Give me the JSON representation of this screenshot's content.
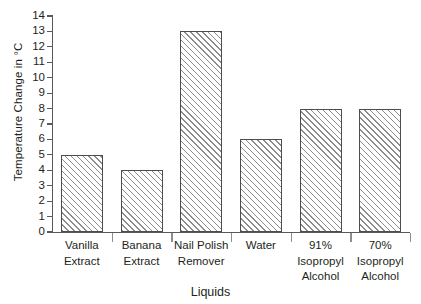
{
  "chart_data": {
    "type": "bar",
    "title": "",
    "xlabel": "Liquids",
    "ylabel": "Temperature Change in °C",
    "categories": [
      "Vanilla Extract",
      "Banana Extract",
      "Nail Polish Remover",
      "Water",
      "91% Isopropyl Alcohol",
      "70% Isopropyl Alcohol"
    ],
    "category_lines": [
      [
        "Vanilla",
        "Extract"
      ],
      [
        "Banana",
        "Extract"
      ],
      [
        "Nail Polish",
        "Remover"
      ],
      [
        "Water"
      ],
      [
        "91%",
        "Isopropyl",
        "Alcohol"
      ],
      [
        "70%",
        "Isopropyl",
        "Alcohol"
      ]
    ],
    "values": [
      5,
      4,
      13,
      6,
      8,
      8
    ],
    "ylim": [
      0,
      14
    ],
    "ytick_step": 1,
    "ytick_labels": [
      "0",
      "1",
      "2",
      "3",
      "4",
      "5",
      "6",
      "7",
      "8",
      "9",
      "10",
      "11",
      "12",
      "13",
      "14"
    ],
    "grid": false,
    "legend": false,
    "bar_fill": "#ffffff",
    "bar_hatch": "diagonal-45",
    "bar_hatch_color": "#8c8c8e",
    "bar_border_color": "#4d4d4f",
    "axis_color": "#58595b",
    "text_color": "#231f20"
  }
}
